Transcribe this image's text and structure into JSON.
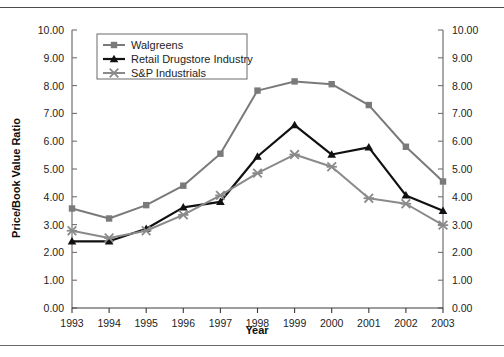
{
  "chart_data": {
    "type": "line",
    "title": "",
    "xlabel": "Year",
    "ylabel": "Price/Book Value Ratio",
    "categories": [
      "1993",
      "1994",
      "1995",
      "1996",
      "1997",
      "1998",
      "1999",
      "2000",
      "2001",
      "2002",
      "2003"
    ],
    "x": [
      1993,
      1994,
      1995,
      1996,
      1997,
      1998,
      1999,
      2000,
      2001,
      2002,
      2003
    ],
    "xlim": [
      1993,
      2003
    ],
    "ylim": [
      0.0,
      10.0
    ],
    "ytick_labels": [
      "0.00",
      "1.00",
      "2.00",
      "3.00",
      "4.00",
      "5.00",
      "6.00",
      "7.00",
      "8.00",
      "9.00",
      "10.00"
    ],
    "ytick_values": [
      0,
      1,
      2,
      3,
      4,
      5,
      6,
      7,
      8,
      9,
      10
    ],
    "yticks_step": 1.0,
    "grid": false,
    "dual_y_axis": true,
    "right_axis_mirrors_left": true,
    "legend_position": "top-left inside plot",
    "series": [
      {
        "name": "Walgreens",
        "marker": "square",
        "color": "#7a7a7a",
        "values": [
          3.58,
          3.22,
          3.7,
          4.4,
          5.55,
          7.82,
          8.15,
          8.05,
          7.3,
          5.8,
          4.55
        ]
      },
      {
        "name": "Retail Drugstore Industry",
        "marker": "triangle",
        "color": "#111111",
        "values": [
          2.4,
          2.4,
          2.85,
          3.62,
          3.82,
          5.45,
          6.58,
          5.52,
          5.78,
          4.05,
          3.5
        ]
      },
      {
        "name": "S&P Industrials",
        "marker": "x",
        "color": "#8a8a8a",
        "values": [
          2.78,
          2.52,
          2.78,
          3.35,
          4.05,
          4.85,
          5.52,
          5.08,
          3.95,
          3.75,
          2.98
        ]
      }
    ]
  },
  "axes": {
    "left_axis_name": "left-y-axis",
    "right_axis_name": "right-y-axis",
    "x_axis_name": "x-axis"
  }
}
